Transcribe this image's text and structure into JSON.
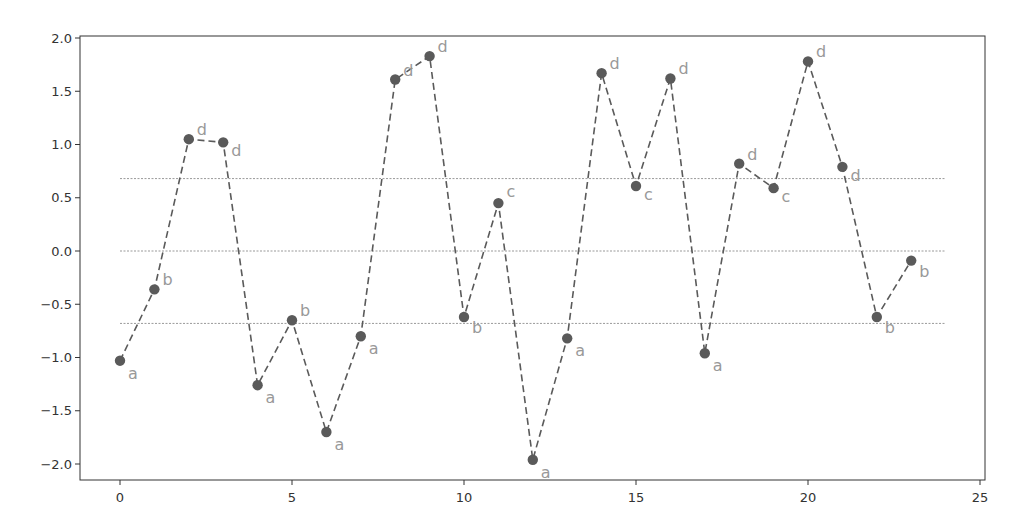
{
  "chart_data": {
    "type": "line",
    "title": "",
    "xlabel": "",
    "ylabel": "",
    "xlim": [
      -1.2,
      25.2
    ],
    "ylim": [
      -2.15,
      2.03
    ],
    "grid": false,
    "legend": null,
    "x_ticks": [
      0,
      5,
      10,
      15,
      20,
      25
    ],
    "y_ticks": [
      2.0,
      1.5,
      1.0,
      0.5,
      0.0,
      -0.5,
      -1.0,
      -1.5,
      -2.0
    ],
    "x_tick_labels": [
      "0",
      "5",
      "10",
      "15",
      "20",
      "25"
    ],
    "y_tick_labels": [
      "2.0",
      "1.5",
      "1.0",
      "0.5",
      "0.0",
      "−0.5",
      "−1.0",
      "−1.5",
      "−2.0"
    ],
    "series": [
      {
        "name": "values",
        "style": "dashed line with circle markers",
        "color": "#5a5a5a",
        "x": [
          0,
          1,
          2,
          3,
          4,
          5,
          6,
          7,
          8,
          9,
          10,
          11,
          12,
          13,
          14,
          15,
          16,
          17,
          18,
          19,
          20,
          21,
          22,
          23
        ],
        "values": [
          -1.03,
          -0.36,
          1.05,
          1.02,
          -1.26,
          -0.65,
          -1.7,
          -0.8,
          1.61,
          1.83,
          -0.62,
          0.45,
          -1.96,
          -0.82,
          1.67,
          0.61,
          1.62,
          -0.96,
          0.82,
          0.59,
          1.78,
          0.79,
          -0.62,
          -0.09
        ],
        "point_labels": [
          "a",
          "b",
          "d",
          "d",
          "a",
          "b",
          "a",
          "a",
          "d",
          "d",
          "b",
          "c",
          "a",
          "a",
          "d",
          "c",
          "d",
          "a",
          "d",
          "c",
          "d",
          "d",
          "b",
          "b"
        ]
      }
    ],
    "reference_lines": [
      {
        "y": 0.68,
        "style": "dotted",
        "color": "#999999",
        "x_range": [
          0,
          24
        ]
      },
      {
        "y": 0.0,
        "style": "dotted",
        "color": "#999999",
        "x_range": [
          0,
          24
        ]
      },
      {
        "y": -0.68,
        "style": "dotted",
        "color": "#999999",
        "x_range": [
          0,
          24
        ]
      }
    ],
    "colors": {
      "line": "#5a5a5a",
      "marker": "#5a5a5a",
      "point_label": "#999999",
      "axis": "#333333",
      "reference": "#999999"
    }
  }
}
